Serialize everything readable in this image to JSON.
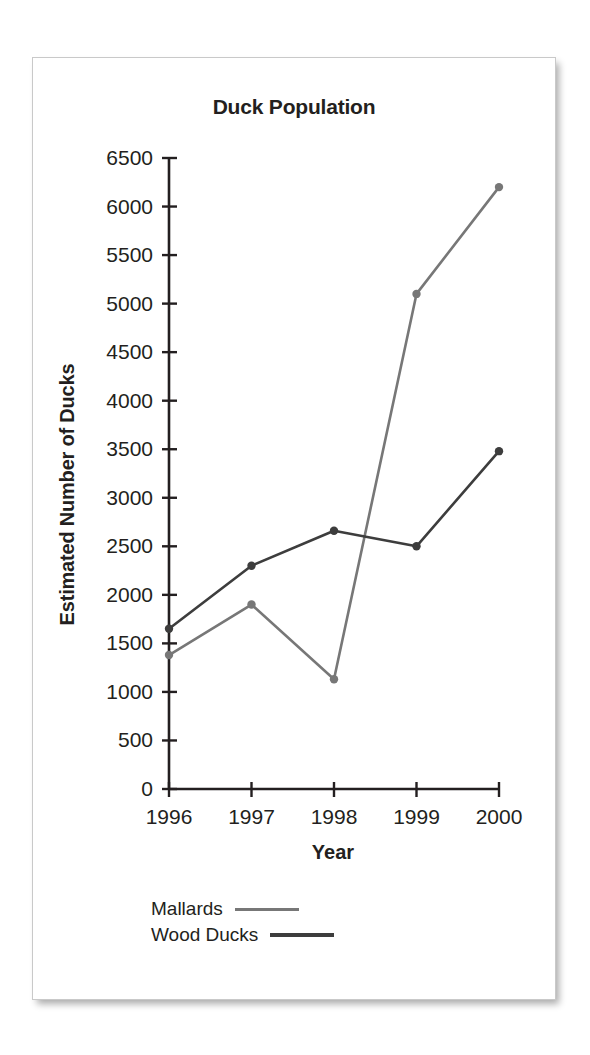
{
  "card": {
    "title": "Duck Population"
  },
  "axes": {
    "x_title": "Year",
    "y_title": "Estimated Number of Ducks",
    "y_ticks": [
      "6500",
      "6000",
      "5500",
      "5000",
      "4500",
      "4000",
      "3500",
      "3000",
      "2500",
      "2000",
      "1500",
      "1000",
      "500",
      "0"
    ],
    "x_ticks": [
      "1996",
      "1997",
      "1998",
      "1999",
      "2000"
    ]
  },
  "legend": {
    "items": [
      {
        "label": "Mallards",
        "color": "#777777"
      },
      {
        "label": "Wood Ducks",
        "color": "#3d3d3d"
      }
    ]
  },
  "chart_data": {
    "type": "line",
    "title": "Duck Population",
    "xlabel": "Year",
    "ylabel": "Estimated Number of Ducks",
    "categories": [
      "1996",
      "1997",
      "1998",
      "1999",
      "2000"
    ],
    "x": [
      1996,
      1997,
      1998,
      1999,
      2000
    ],
    "ylim": [
      0,
      6500
    ],
    "ytick_step": 500,
    "grid": false,
    "legend_position": "below-axis-left",
    "series": [
      {
        "name": "Mallards",
        "color": "#777777",
        "values": [
          1380,
          1900,
          1130,
          5100,
          6200
        ]
      },
      {
        "name": "Wood Ducks",
        "color": "#3d3d3d",
        "values": [
          1650,
          2300,
          2660,
          2500,
          3480
        ]
      }
    ]
  }
}
